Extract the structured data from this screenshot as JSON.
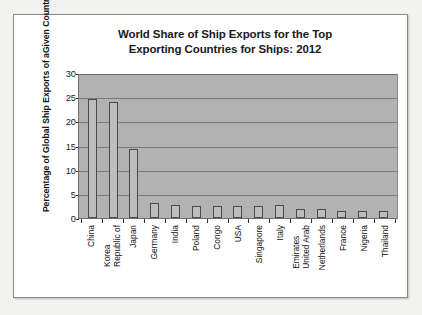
{
  "chart_data": {
    "type": "bar",
    "title": "World Share of Ship Exports for the Top Exporting Countries for Ships: 2012",
    "title_line1": "World Share of Ship Exports for the Top",
    "title_line2": "Exporting Countries for Ships: 2012",
    "xlabel": "",
    "ylabel": "Percentage of Global Ship Exports of a Given Country",
    "ylabel_line1": "Percentage of Global Ship Exports of a",
    "ylabel_line2": "Given Country",
    "ylim": [
      0,
      30
    ],
    "yticks": [
      0,
      5,
      10,
      15,
      20,
      25,
      30
    ],
    "ytick_labels": [
      "0",
      "5",
      "10",
      "15",
      "20",
      "25",
      "30"
    ],
    "grid": true,
    "grid_axis": "y",
    "legend": false,
    "categories": [
      "China",
      "Republic of Korea",
      "Japan",
      "Germany",
      "India",
      "Poland",
      "Congo",
      "USA",
      "Singapore",
      "Italy",
      "United Arab Emirates",
      "Netherlands",
      "France",
      "Nigeria",
      "Thailand"
    ],
    "category_label_lines": [
      [
        "China"
      ],
      [
        "Republic of",
        "Korea"
      ],
      [
        "Japan"
      ],
      [
        "Germany"
      ],
      [
        "India"
      ],
      [
        "Poland"
      ],
      [
        "Congo"
      ],
      [
        "USA"
      ],
      [
        "Singapore"
      ],
      [
        "Italy"
      ],
      [
        "United Arab",
        "Emirates"
      ],
      [
        "Netherlands"
      ],
      [
        "France"
      ],
      [
        "Nigeria"
      ],
      [
        "Thailand"
      ]
    ],
    "values": [
      24.7,
      24.0,
      14.2,
      3.1,
      2.6,
      2.5,
      2.5,
      2.4,
      2.4,
      2.6,
      1.9,
      1.8,
      1.5,
      1.5,
      1.4
    ],
    "colors": {
      "plot_background": "#b2b2b2",
      "bar_fill": "#bdbdbd",
      "bar_border": "#4a4a4a",
      "gridline": "#7a7a7a",
      "axis": "#333333",
      "text": "#111111",
      "card_background": "#ffffff",
      "page_background": "#f2f2f0"
    }
  }
}
